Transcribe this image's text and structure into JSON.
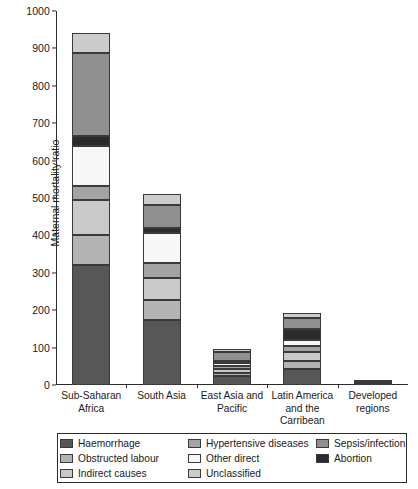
{
  "chart_data": {
    "type": "bar",
    "subtype": "stacked-vertical",
    "title": "",
    "xlabel": "",
    "ylabel": "Maternal mortality ratio",
    "ylim": [
      0,
      1000
    ],
    "yticks": [
      0,
      100,
      200,
      300,
      400,
      500,
      600,
      700,
      800,
      900,
      1000
    ],
    "grid": false,
    "legend_position": "bottom",
    "categories": [
      "Sub-Saharan Africa",
      "South Asia",
      "East Asia and Pacific",
      "Latin America and the Carribean",
      "Developed regions"
    ],
    "category_lines": [
      [
        "Sub-Saharan",
        "Africa"
      ],
      [
        "South Asia",
        ""
      ],
      [
        "East Asia and",
        "Pacific"
      ],
      [
        "Latin America",
        "and the Carribean"
      ],
      [
        "Developed",
        "regions"
      ]
    ],
    "series": [
      {
        "name": "Haemorrhage",
        "color": "#575757",
        "values": [
          320,
          175,
          25,
          42,
          3
        ]
      },
      {
        "name": "Obstructed labour",
        "color": "#b3b3b3",
        "values": [
          80,
          52,
          8,
          22,
          1
        ]
      },
      {
        "name": "Indirect causes",
        "color": "#c9c9c9",
        "values": [
          95,
          58,
          11,
          25,
          1.5
        ]
      },
      {
        "name": "Hypertensive diseases",
        "color": "#a3a3a3",
        "values": [
          38,
          42,
          7,
          14,
          0.8
        ]
      },
      {
        "name": "Other direct",
        "color": "#f7f7f7",
        "values": [
          105,
          80,
          9,
          18,
          0.8
        ]
      },
      {
        "name": "Abortion",
        "color": "#2b2b2b",
        "values": [
          28,
          13,
          5,
          28,
          0.5
        ]
      },
      {
        "name": "Sepsis/infection",
        "color": "#8f8f8f",
        "values": [
          222,
          62,
          22,
          30,
          1.5
        ]
      },
      {
        "name": "Unclassified",
        "color": "#cccccc",
        "values": [
          52,
          28,
          8,
          14,
          1
        ]
      }
    ],
    "totals": [
      940,
      510,
      95,
      193,
      10
    ]
  },
  "legend": {
    "items": [
      {
        "label": "Haemorrhage",
        "color": "#575757",
        "col": 0,
        "row": 0
      },
      {
        "label": "Obstructed labour",
        "color": "#b3b3b3",
        "col": 0,
        "row": 1
      },
      {
        "label": "Indirect causes",
        "color": "#c9c9c9",
        "col": 0,
        "row": 2
      },
      {
        "label": "Hypertensive diseases",
        "color": "#a3a3a3",
        "col": 1,
        "row": 0
      },
      {
        "label": "Other direct",
        "color": "#f7f7f7",
        "col": 1,
        "row": 1
      },
      {
        "label": "Unclassified",
        "color": "#cccccc",
        "col": 1,
        "row": 2
      },
      {
        "label": "Sepsis/infection",
        "color": "#8f8f8f",
        "col": 2,
        "row": 0
      },
      {
        "label": "Abortion",
        "color": "#2b2b2b",
        "col": 2,
        "row": 1
      }
    ]
  }
}
